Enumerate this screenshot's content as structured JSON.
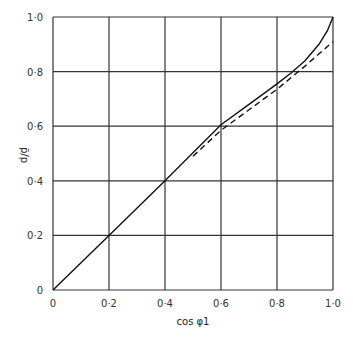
{
  "chart_data": {
    "type": "line",
    "title": "",
    "xlabel": "cos φ1",
    "ylabel": "p̄/p",
    "xlim": [
      0,
      1.0
    ],
    "ylim": [
      0,
      1.0
    ],
    "grid": true,
    "x_ticks": [
      "0",
      "0·2",
      "0·4",
      "0·6",
      "0·8",
      "1·0"
    ],
    "y_ticks": [
      "0",
      "0·2",
      "0·4",
      "0·6",
      "0·8",
      "1·0"
    ],
    "series": [
      {
        "name": "solid",
        "style": "solid",
        "x": [
          0,
          0.2,
          0.4,
          0.6,
          0.7,
          0.8,
          0.85,
          0.9,
          0.95,
          0.98,
          1.0
        ],
        "y": [
          0,
          0.2,
          0.4,
          0.605,
          0.68,
          0.755,
          0.795,
          0.84,
          0.9,
          0.95,
          1.0
        ]
      },
      {
        "name": "dashed",
        "style": "dashed",
        "x": [
          0.5,
          0.6,
          0.7,
          0.8,
          0.9,
          1.0
        ],
        "y": [
          0.49,
          0.585,
          0.66,
          0.735,
          0.82,
          0.91
        ]
      }
    ]
  }
}
